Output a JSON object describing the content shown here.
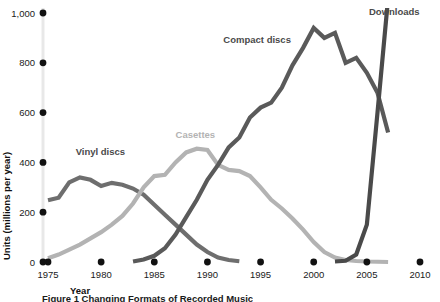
{
  "chart_data": {
    "type": "line",
    "title": "",
    "xlabel": "Year",
    "ylabel": "Units (millions per year)",
    "xlim": [
      1975,
      2010
    ],
    "ylim": [
      0,
      1000
    ],
    "grid": false,
    "legend_position": "inline-labels",
    "x_ticks": [
      "1975",
      "1980",
      "1985",
      "1990",
      "1995",
      "2000",
      "2005",
      "2010"
    ],
    "y_ticks": [
      "0",
      "200",
      "400",
      "600",
      "800",
      "1,000"
    ],
    "series": [
      {
        "name": "Vinyl discs",
        "color": "#6e6e6e",
        "label_x": 1977.6,
        "label_y": 430,
        "x": [
          1975,
          1976,
          1977,
          1978,
          1979,
          1980,
          1981,
          1982,
          1983,
          1984,
          1985,
          1986,
          1987,
          1988,
          1989,
          1990,
          1991,
          1992,
          1993
        ],
        "y": [
          248,
          258,
          320,
          340,
          330,
          305,
          318,
          310,
          295,
          270,
          230,
          190,
          150,
          110,
          70,
          40,
          18,
          8,
          3
        ]
      },
      {
        "name": "Casettes",
        "color": "#b3b3b3",
        "label_x": 1987.0,
        "label_y": 500,
        "x": [
          1975,
          1976,
          1977,
          1978,
          1979,
          1980,
          1981,
          1982,
          1983,
          1984,
          1985,
          1986,
          1987,
          1988,
          1989,
          1990,
          1991,
          1992,
          1993,
          1994,
          1995,
          1996,
          1997,
          1998,
          1999,
          2000,
          2001,
          2002,
          2003,
          2004,
          2005,
          2006,
          2007
        ],
        "y": [
          15,
          30,
          50,
          70,
          95,
          120,
          150,
          185,
          235,
          300,
          345,
          350,
          400,
          440,
          455,
          450,
          390,
          370,
          365,
          345,
          300,
          250,
          215,
          175,
          130,
          80,
          40,
          18,
          8,
          4,
          2,
          1,
          0
        ]
      },
      {
        "name": "Compact discs",
        "color": "#5a5a5a",
        "label_x": 1991.5,
        "label_y": 880,
        "x": [
          1983,
          1984,
          1985,
          1986,
          1987,
          1988,
          1989,
          1990,
          1991,
          1992,
          1993,
          1994,
          1995,
          1996,
          1997,
          1998,
          1999,
          2000,
          2001,
          2002,
          2003,
          2004,
          2005,
          2006,
          2007
        ],
        "y": [
          2,
          10,
          25,
          55,
          110,
          180,
          250,
          330,
          390,
          460,
          500,
          580,
          620,
          640,
          700,
          790,
          860,
          940,
          900,
          920,
          800,
          820,
          760,
          680,
          520
        ]
      },
      {
        "name": "Downloads",
        "color": "#4a4a4a",
        "label_x": 2005.2,
        "label_y": 990,
        "x": [
          2002,
          2003,
          2004,
          2005,
          2006,
          2007
        ],
        "y": [
          2,
          5,
          30,
          150,
          600,
          1060
        ]
      }
    ]
  },
  "caption": {
    "text": "Figure 1 Changing Formats of Recorded Music"
  }
}
